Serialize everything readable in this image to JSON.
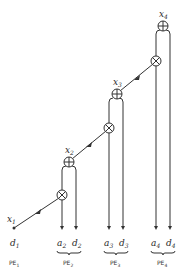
{
  "diagram": {
    "type": "systolic-array",
    "colors": {
      "stroke": "#333333",
      "background": "#ffffff"
    },
    "inputs": [
      {
        "name": "x1",
        "base": "x",
        "sub": "1"
      }
    ],
    "outputs": [
      {
        "name": "x2",
        "base": "x",
        "sub": "2"
      },
      {
        "name": "x3",
        "base": "x",
        "sub": "3"
      },
      {
        "name": "x4",
        "base": "x",
        "sub": "4"
      }
    ],
    "operators": {
      "add": "⊕",
      "multiply": "⊗"
    },
    "bottom_labels": [
      {
        "name": "d1",
        "base": "d",
        "sub": "1"
      },
      {
        "name": "a2",
        "base": "a",
        "sub": "2"
      },
      {
        "name": "d2",
        "base": "d",
        "sub": "2"
      },
      {
        "name": "a3",
        "base": "a",
        "sub": "3"
      },
      {
        "name": "d3",
        "base": "d",
        "sub": "3"
      },
      {
        "name": "a4",
        "base": "a",
        "sub": "4"
      },
      {
        "name": "d4",
        "base": "d",
        "sub": "4"
      }
    ],
    "processing_elements": [
      {
        "label": "PE",
        "sub": "1"
      },
      {
        "label": "PE",
        "sub": "2"
      },
      {
        "label": "PE",
        "sub": "3"
      },
      {
        "label": "PE",
        "sub": "4"
      }
    ]
  }
}
